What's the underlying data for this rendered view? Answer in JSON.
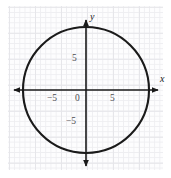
{
  "figure": {
    "background_color": "#ffffff",
    "grid_color": "#eeeef1",
    "axis_color": "#1a1a1a",
    "curve_color": "#1a1a1a"
  },
  "axes": {
    "x_name": "x",
    "y_name": "y",
    "x_ticks": [
      {
        "id": "x-neg5",
        "label": "−5",
        "value": -5
      },
      {
        "id": "x-zero",
        "label": "0",
        "value": 0
      },
      {
        "id": "x-pos5",
        "label": "5",
        "value": 5
      }
    ],
    "y_ticks": [
      {
        "id": "y-pos5",
        "label": "5",
        "value": 5
      },
      {
        "id": "y-neg5",
        "label": "−5",
        "value": -5
      }
    ]
  },
  "chart_data": {
    "type": "line",
    "title": "",
    "subtitle": "",
    "xlabel": "x",
    "ylabel": "y",
    "xlim": [
      -10,
      9.5
    ],
    "ylim": [
      -10.5,
      10.5
    ],
    "grid": true,
    "legend": null,
    "series": [
      {
        "name": "circle",
        "shape": "circle",
        "center": [
          0,
          0
        ],
        "radius": 8,
        "equation": "x^2 + y^2 = 64",
        "x_intercepts": [
          -8,
          8
        ],
        "y_intercepts": [
          -8,
          8
        ]
      }
    ],
    "annotations": []
  }
}
